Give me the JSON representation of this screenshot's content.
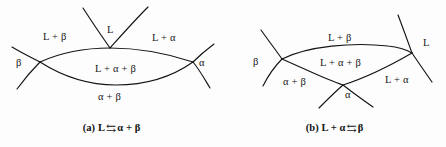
{
  "figure": {
    "background_color": "#fdfdfd",
    "line_color": "#141414"
  },
  "panel_a": {
    "caption_prefix": "(a)",
    "caption_left": "L",
    "caption_arrows": "⇆",
    "caption_right": "α + β",
    "labels": {
      "top_center": "L",
      "upper_left": "L + β",
      "upper_right": "L + α",
      "far_left": "β",
      "far_right": "α",
      "center": "L + α + β",
      "bottom": "α + β"
    }
  },
  "panel_b": {
    "caption_prefix": "(b)",
    "caption_left": "L + α",
    "caption_arrows": "⇆",
    "caption_right": "β",
    "labels": {
      "top_center": "L + β",
      "far_right": "L",
      "far_left": "β",
      "center": "L + α + β",
      "lower_left": "α + β",
      "lower_right": "L + α",
      "bottom_center": "α"
    }
  }
}
